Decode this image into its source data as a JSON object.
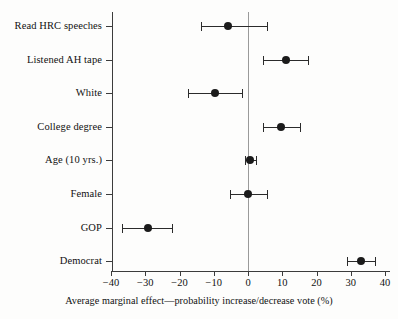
{
  "chart_data": {
    "type": "scatter",
    "title": "",
    "subtitle": "",
    "xlabel": "Average marginal effect—probability increase/decrease vote (%)",
    "ylabel": "",
    "xlim": [
      -40,
      40
    ],
    "xticks": [
      -40,
      -30,
      -20,
      -10,
      0,
      10,
      20,
      30,
      40
    ],
    "xticklabels": [
      "−40",
      "−30",
      "−20",
      "−10",
      "0",
      "10",
      "20",
      "30",
      "40"
    ],
    "grid": false,
    "legend": null,
    "reference_line": 0,
    "categories": [
      "Read HRC speeches",
      "Listened AH tape",
      "White",
      "College degree",
      "Age (10 yrs.)",
      "Female",
      "GOP",
      "Democrat"
    ],
    "values": [
      -5.8,
      11.0,
      -9.7,
      9.7,
      0.6,
      0.0,
      -29.2,
      33.0
    ],
    "ci_low": [
      -13.7,
      4.4,
      -17.5,
      4.4,
      -1.0,
      -5.3,
      -36.8,
      28.8
    ],
    "ci_high": [
      5.5,
      17.5,
      -1.8,
      15.2,
      2.3,
      5.5,
      -22.2,
      37.1
    ],
    "points": [
      {
        "label": "Read HRC speeches",
        "estimate": -5.8,
        "ci_low": -13.7,
        "ci_high": 5.5
      },
      {
        "label": "Listened AH tape",
        "estimate": 11.0,
        "ci_low": 4.4,
        "ci_high": 17.5
      },
      {
        "label": "White",
        "estimate": -9.7,
        "ci_low": -17.5,
        "ci_high": -1.8
      },
      {
        "label": "College degree",
        "estimate": 9.7,
        "ci_low": 4.4,
        "ci_high": 15.2
      },
      {
        "label": "Age (10 yrs.)",
        "estimate": 0.6,
        "ci_low": -1.0,
        "ci_high": 2.3
      },
      {
        "label": "Female",
        "estimate": 0.0,
        "ci_low": -5.3,
        "ci_high": 5.5
      },
      {
        "label": "GOP",
        "estimate": -29.2,
        "ci_low": -36.8,
        "ci_high": -22.2
      },
      {
        "label": "Democrat",
        "estimate": 33.0,
        "ci_low": 28.8,
        "ci_high": 37.1
      }
    ]
  },
  "axis": {
    "x_title": "Average marginal effect—probability increase/decrease vote (%)",
    "tick_labels": [
      "−40",
      "−30",
      "−20",
      "−10",
      "0",
      "10",
      "20",
      "30",
      "40"
    ]
  },
  "colors": {
    "marker": "#1b1b1b",
    "error_bar": "#2b2b2b",
    "axis": "#3c3c3c",
    "zero_line": "#9a9a9a",
    "background": "#fdfdfc",
    "text": "#111111"
  }
}
